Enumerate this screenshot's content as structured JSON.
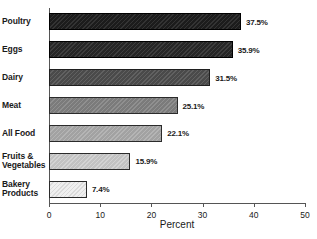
{
  "chart_data": {
    "type": "bar",
    "orientation": "horizontal",
    "title": "",
    "xlabel": "Percent",
    "ylabel": "",
    "xlim": [
      0,
      50
    ],
    "xticks": [
      0,
      10,
      20,
      30,
      40,
      50
    ],
    "xtick_labels": [
      "0",
      "10",
      "20",
      "30",
      "40",
      "50"
    ],
    "grid": false,
    "legend": null,
    "categories": [
      "Poultry",
      "Eggs",
      "Dairy",
      "Meat",
      "All Food",
      "Fruits & Vegetables",
      "Bakery Products"
    ],
    "category_lines": [
      [
        "Poultry"
      ],
      [
        "Eggs"
      ],
      [
        "Dairy"
      ],
      [
        "Meat"
      ],
      [
        "All Food"
      ],
      [
        "Fruits &",
        "Vegetables"
      ],
      [
        "Bakery",
        "Products"
      ]
    ],
    "values": [
      37.5,
      35.9,
      31.5,
      25.1,
      22.1,
      15.9,
      7.4
    ],
    "value_labels": [
      "37.5%",
      "35.9%",
      "31.5%",
      "25.1%",
      "22.1%",
      "15.9%",
      "7.4%"
    ],
    "bar_colors": [
      "#1c1c1c",
      "#262626",
      "#4a4a4a",
      "#7b7b7b",
      "#a2a2a2",
      "#c2c2c2",
      "#efefef"
    ],
    "bar_pattern": "diagonal-hatch",
    "axis_color": "#555555",
    "text_color": "#1a1a1a",
    "background": "#ffffff"
  }
}
